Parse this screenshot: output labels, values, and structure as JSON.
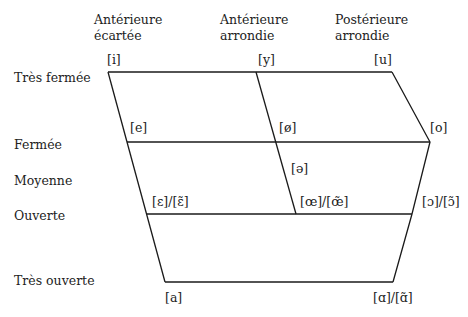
{
  "columns": [
    {
      "line1": "Antérieure",
      "line2": "écartée"
    },
    {
      "line1": "Antérieure",
      "line2": "arrondie"
    },
    {
      "line1": "Postérieure",
      "line2": "arrondie"
    }
  ],
  "rows": {
    "tres_fermee": "Très fermée",
    "fermee": "Fermée",
    "moyenne": "Moyenne",
    "ouverte": "Ouverte",
    "tres_ouverte": "Très ouverte"
  },
  "vowels": {
    "i": "[i]",
    "y": "[y]",
    "u": "[u]",
    "e": "[e]",
    "o_slash": "[ø]",
    "o": "[o]",
    "schwa": "[ə]",
    "epsilon": "[ɛ]/[ɛ̃]",
    "oe": "[œ]/[œ̃]",
    "open_o": "[ɔ]/[ɔ̃]",
    "a": "[a]",
    "alpha": "[ɑ]/[ɑ̃]"
  },
  "colors": {
    "line": "#1a1a1a",
    "text": "#222222"
  }
}
